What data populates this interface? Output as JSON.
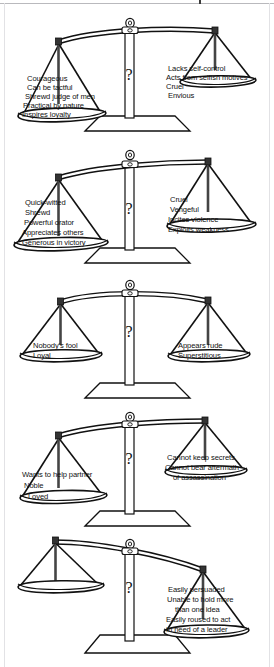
{
  "document": {
    "title": "Balance of character traits",
    "type": "five-balance-scale-diagram",
    "ink_color": "#111111",
    "background_color": "#ffffff"
  },
  "scales": [
    {
      "id": "scale-1",
      "tilt": "left-down",
      "pointer_glyph": "?",
      "left_pan": {
        "name": "virtues",
        "traits": [
          "Courageous",
          "Can be tactful",
          "Shrewd judge of men",
          "Practical by nature",
          "Inspires loyalty"
        ]
      },
      "right_pan": {
        "name": "vices",
        "traits": [
          "Lacks self-control",
          "Acts from selfish motives",
          "Cruel",
          "Envious"
        ]
      }
    },
    {
      "id": "scale-2",
      "tilt": "left-down",
      "pointer_glyph": "?",
      "left_pan": {
        "name": "virtues",
        "traits": [
          "Quick-witted",
          "Shrewd",
          "Powerful orator",
          "Appreciates others",
          "Generous in victory"
        ]
      },
      "right_pan": {
        "name": "vices",
        "traits": [
          "Cruel",
          "Vengeful",
          "Incites violence",
          "Exploits weakness"
        ]
      }
    },
    {
      "id": "scale-3",
      "tilt": "level",
      "pointer_glyph": "?",
      "left_pan": {
        "name": "virtues",
        "traits": [
          "Nobody's fool",
          "Loyal"
        ]
      },
      "right_pan": {
        "name": "vices",
        "traits": [
          "Appears rude",
          "Superstitious"
        ]
      }
    },
    {
      "id": "scale-4",
      "tilt": "left-down",
      "pointer_glyph": "?",
      "left_pan": {
        "name": "virtues",
        "traits": [
          "Wants to help partner",
          "Noble",
          "Loved"
        ]
      },
      "right_pan": {
        "name": "vices",
        "traits": [
          "Cannot keep secrets",
          "Cannot bear aftermath",
          "of assassination"
        ]
      }
    },
    {
      "id": "scale-5",
      "tilt": "left-down-heavy",
      "pointer_glyph": "?",
      "left_pan": {
        "name": "virtues",
        "traits": []
      },
      "right_pan": {
        "name": "vices",
        "traits": [
          "Easily persuaded",
          "Unable to hold more",
          "than one idea",
          "Easily roused to act",
          "In need of a leader"
        ]
      }
    }
  ]
}
